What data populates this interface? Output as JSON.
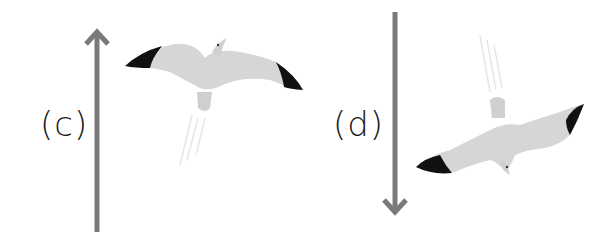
{
  "panels": [
    {
      "id": "c",
      "label": "(c)",
      "arrow_direction": "up",
      "description": "bird flying upward with motion streaks below"
    },
    {
      "id": "d",
      "label": "(d)",
      "arrow_direction": "down",
      "description": "bird diving downward with motion streaks above"
    }
  ],
  "colors": {
    "arrow": "#7a7a7a",
    "bird_body": "#d4d4d4",
    "wing_tip": "#111111",
    "streak": "#e2e2e2",
    "label": "#1a1a1a"
  }
}
